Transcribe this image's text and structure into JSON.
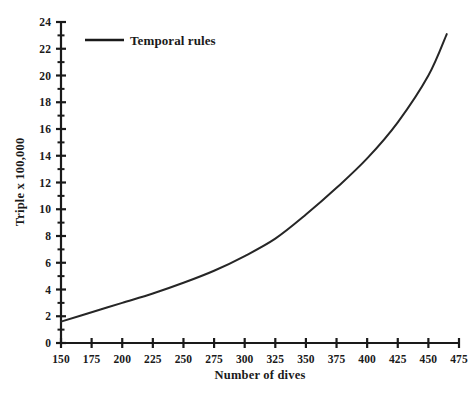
{
  "chart_data": {
    "type": "line",
    "title": "",
    "xlabel": "Number of dives",
    "ylabel": "Triple x 100,000",
    "xlim": [
      150,
      475
    ],
    "ylim": [
      0,
      24
    ],
    "grid": false,
    "legend_position": "top-left-inside",
    "x_ticks": [
      150,
      175,
      200,
      225,
      250,
      275,
      300,
      325,
      350,
      375,
      400,
      425,
      450,
      475
    ],
    "x_tick_labels": [
      "150",
      "175",
      "200",
      "225",
      "250",
      "275",
      "300",
      "325",
      "350",
      "375",
      "400",
      "425",
      "450",
      "475"
    ],
    "y_ticks": [
      0,
      2,
      4,
      6,
      8,
      10,
      12,
      14,
      16,
      18,
      20,
      22,
      24
    ],
    "y_tick_labels": [
      "0",
      "2",
      "4",
      "6",
      "8",
      "10",
      "12",
      "14",
      "16",
      "18",
      "20",
      "22",
      "24"
    ],
    "y_minor_ticks": [
      1,
      3,
      5,
      7,
      9,
      11,
      13,
      15,
      17,
      19,
      21,
      23
    ],
    "series": [
      {
        "name": "Temporal rules",
        "color": "#262626",
        "x": [
          150,
          175,
          200,
          225,
          250,
          275,
          300,
          325,
          350,
          375,
          400,
          425,
          450,
          465
        ],
        "values": [
          1.6,
          2.3,
          3.0,
          3.7,
          4.5,
          5.4,
          6.5,
          7.8,
          9.6,
          11.6,
          13.8,
          16.5,
          20.0,
          23.1
        ]
      }
    ]
  },
  "legend": {
    "entries": [
      {
        "label": "Temporal rules",
        "color": "#1a1a1a"
      }
    ]
  },
  "axes": {
    "x_title": "Number of dives",
    "y_title": "Triple x 100,000"
  }
}
